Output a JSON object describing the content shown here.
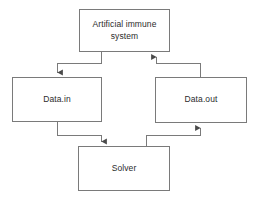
{
  "diagram": {
    "background_color": "#ffffff",
    "stroke_color": "#7a7a7a",
    "text_color": "#2b2b2b",
    "nodes": [
      {
        "id": "ais",
        "label": "Artificial immune\nsystem",
        "shape": "rectangle"
      },
      {
        "id": "in",
        "label": "Data.in",
        "shape": "rectangle"
      },
      {
        "id": "out",
        "label": "Data.out",
        "shape": "rectangle"
      },
      {
        "id": "solver",
        "label": "Solver",
        "shape": "rectangle"
      }
    ],
    "edges": [
      {
        "id": "ais-to-in",
        "from": "ais",
        "to": "in",
        "style": "orthogonal",
        "arrow": "down"
      },
      {
        "id": "in-to-solver",
        "from": "in",
        "to": "solver",
        "style": "orthogonal",
        "arrow": "down"
      },
      {
        "id": "solver-to-out",
        "from": "solver",
        "to": "out",
        "style": "orthogonal",
        "arrow": "up"
      },
      {
        "id": "out-to-ais",
        "from": "out",
        "to": "ais",
        "style": "orthogonal",
        "arrow": "up"
      }
    ]
  }
}
